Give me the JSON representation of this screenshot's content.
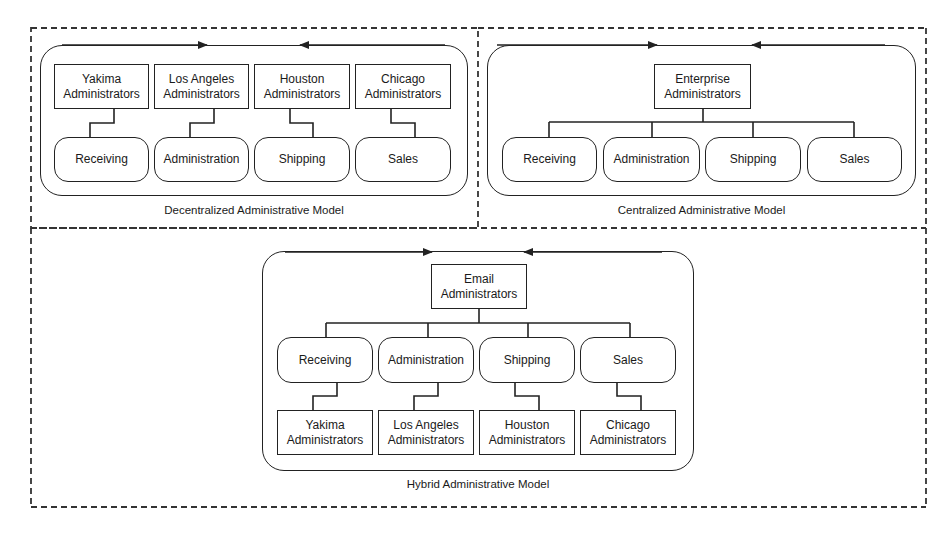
{
  "diagram": {
    "panels": [
      {
        "id": "decentralized",
        "caption": "Decentralized Administrative Model",
        "admins": [
          "Yakima\nAdministrators",
          "Los Angeles\nAdministrators",
          "Houston\nAdministrators",
          "Chicago\nAdministrators"
        ],
        "departments": [
          "Receiving",
          "Administration",
          "Shipping",
          "Sales"
        ]
      },
      {
        "id": "centralized",
        "caption": "Centralized Administrative Model",
        "root": "Enterprise\nAdministrators",
        "departments": [
          "Receiving",
          "Administration",
          "Shipping",
          "Sales"
        ]
      },
      {
        "id": "hybrid",
        "caption": "Hybrid Administrative Model",
        "root": "Email\nAdministrators",
        "departments": [
          "Receiving",
          "Administration",
          "Shipping",
          "Sales"
        ],
        "admins": [
          "Yakima\nAdministrators",
          "Los Angeles\nAdministrators",
          "Houston\nAdministrators",
          "Chicago\nAdministrators"
        ]
      }
    ],
    "colors": {
      "line": "#222222",
      "background": "#ffffff"
    }
  }
}
